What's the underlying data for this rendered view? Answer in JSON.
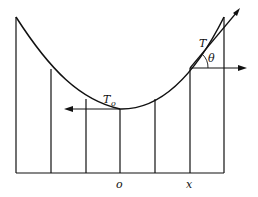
{
  "diagram": {
    "type": "catenary cable with vertical hangers",
    "labels": {
      "tension": "T",
      "tension_min": "T",
      "tension_min_sub": "o",
      "angle": "θ",
      "origin": "o",
      "x": "x"
    },
    "colors": {
      "stroke": "#111111",
      "background": "#ffffff"
    }
  }
}
